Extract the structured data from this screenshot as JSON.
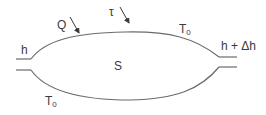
{
  "diagram": {
    "type": "control-volume",
    "stroke_color": "#6b6b6b",
    "text_color": "#3a3a3a",
    "labels": {
      "inlet": "h",
      "outlet": "h + Δh",
      "heat": "Q",
      "work": "τ",
      "temp_top_main": "T",
      "temp_top_sub": "0",
      "temp_bottom_main": "T",
      "temp_bottom_sub": "0",
      "system": "S"
    },
    "arrows": [
      {
        "name": "heat-arrow",
        "label": "Q",
        "direction": "into-system"
      },
      {
        "name": "work-arrow",
        "label": "τ",
        "direction": "into-system"
      }
    ]
  }
}
